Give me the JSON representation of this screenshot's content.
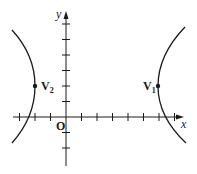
{
  "diagram": {
    "type": "hyperbola-graph",
    "colors": {
      "ink": "#1a1a1a",
      "background": "#ffffff"
    },
    "axes": {
      "x_label": "x",
      "y_label": "y",
      "origin_label": "O",
      "x_ticks": [
        -3,
        -2,
        -1,
        1,
        2,
        3,
        4,
        5,
        6,
        7
      ],
      "y_ticks": [
        -2,
        -1,
        1,
        2,
        3,
        4,
        5,
        6
      ]
    },
    "points": [
      {
        "id": "V1",
        "label": "V",
        "subscript": "1",
        "x": 6,
        "y": 2
      },
      {
        "id": "V2",
        "label": "V",
        "subscript": "2",
        "x": -2,
        "y": 2
      }
    ],
    "curves": [
      {
        "name": "hyperbola-left-branch",
        "vertex": "V2",
        "opens": "left"
      },
      {
        "name": "hyperbola-right-branch",
        "vertex": "V1",
        "opens": "right"
      }
    ]
  }
}
